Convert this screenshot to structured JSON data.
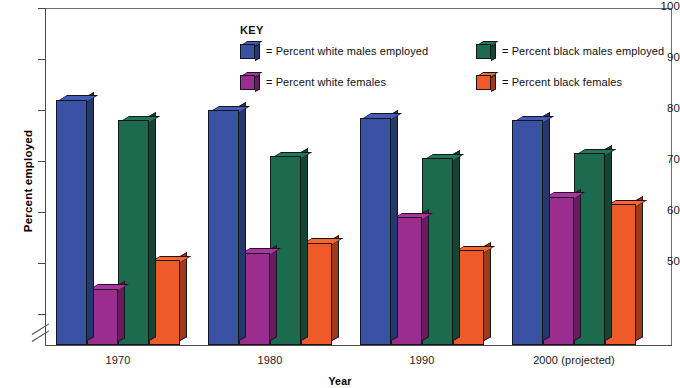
{
  "chart_data": {
    "type": "bar",
    "title": "",
    "xlabel": "Year",
    "ylabel": "Percent employed",
    "categories": [
      "1970",
      "1980",
      "1990",
      "2000 (projected)"
    ],
    "ylim": [
      43,
      100
    ],
    "yticks": [
      50,
      60,
      70,
      80,
      90,
      100
    ],
    "ytick_labels": [
      "50",
      "60",
      "70",
      "80",
      "90",
      "100"
    ],
    "axis_break": true,
    "grid": false,
    "legend_title": "KEY",
    "legend_position": "top-center-inside",
    "series": [
      {
        "name": "= Percent white males employed",
        "short_name": "Percent white males employed",
        "color": "#3b52a4",
        "values": [
          82,
          80,
          78.5,
          78
        ]
      },
      {
        "name": "= Percent white females",
        "short_name": "Percent white females",
        "color": "#9b2d8f",
        "values": [
          45,
          52,
          59,
          63
        ]
      },
      {
        "name": "= Percent black males employed",
        "short_name": "Percent black males employed",
        "color": "#1d6b4f",
        "values": [
          78,
          71,
          70.5,
          71.5
        ]
      },
      {
        "name": "= Percent black females",
        "short_name": "Percent black females",
        "color": "#f05a28",
        "values": [
          50.5,
          54,
          52.5,
          61.5
        ]
      }
    ]
  },
  "axis": {
    "y_title": "Percent employed",
    "x_title": "Year",
    "y_labels": [
      "100",
      "90",
      "80",
      "70",
      "60",
      "50"
    ],
    "x_labels": [
      "1970",
      "1980",
      "1990",
      "2000 (projected)"
    ]
  },
  "legend": {
    "title": "KEY",
    "items": [
      {
        "label": "= Percent white males employed",
        "color": "#3b52a4"
      },
      {
        "label": "= Percent black males employed",
        "color": "#1d6b4f"
      },
      {
        "label": "= Percent white females",
        "color": "#9b2d8f"
      },
      {
        "label": "= Percent black females",
        "color": "#f05a28"
      }
    ]
  },
  "colors": {
    "white_males": "#3b52a4",
    "white_females": "#9b2d8f",
    "black_males": "#1d6b4f",
    "black_females": "#f05a28",
    "axis": "#4a4a4a",
    "background": "#ffffff"
  }
}
